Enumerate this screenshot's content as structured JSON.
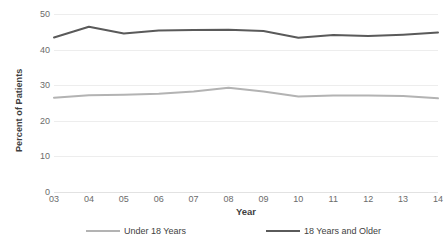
{
  "chart_data": {
    "type": "line",
    "title": "",
    "xlabel": "Year",
    "ylabel": "Percent of Patients",
    "categories": [
      "03",
      "04",
      "05",
      "06",
      "07",
      "08",
      "09",
      "10",
      "11",
      "12",
      "13",
      "14"
    ],
    "x": [
      "03",
      "04",
      "05",
      "06",
      "07",
      "08",
      "09",
      "10",
      "11",
      "12",
      "13",
      "14"
    ],
    "series": [
      {
        "name": "Under 18 Years",
        "color": "#b3b3b3",
        "values": [
          26.5,
          27.2,
          27.3,
          27.6,
          28.2,
          29.3,
          28.2,
          26.8,
          27.1,
          27.1,
          27.0,
          26.3
        ]
      },
      {
        "name": "18 Years and Older",
        "color": "#5a5a5a",
        "values": [
          43.4,
          46.4,
          44.5,
          45.4,
          45.5,
          45.6,
          45.2,
          43.3,
          44.1,
          43.8,
          44.2,
          44.8
        ]
      }
    ],
    "ylim": [
      0,
      50
    ],
    "y_ticks": [
      50,
      40,
      30,
      20,
      10,
      0
    ],
    "y_tick_labels": [
      "50",
      "40",
      "30",
      "20",
      "10",
      "0"
    ],
    "grid": true,
    "legend_position": "bottom"
  },
  "legend": {
    "entries": [
      {
        "label": "Under 18 Years",
        "color": "#b3b3b3"
      },
      {
        "label": "18 Years and Older",
        "color": "#5a5a5a"
      }
    ]
  },
  "axes": {
    "y_title": "Percent of Patients",
    "x_title": "Year"
  }
}
